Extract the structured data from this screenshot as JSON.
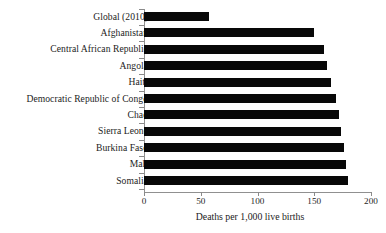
{
  "chart_data": {
    "type": "bar",
    "orientation": "horizontal",
    "title": "",
    "xlabel": "Deaths per 1,000 live births",
    "ylabel": "",
    "xlim": [
      0,
      200
    ],
    "xticks": [
      0,
      50,
      100,
      150,
      200
    ],
    "xtick_labels": [
      "0",
      "50",
      "100",
      "150",
      "200"
    ],
    "grid": false,
    "legend": null,
    "bar_color": "#080808",
    "axis_color": "#909090",
    "categories": [
      "Global (2010)",
      "Afghanistan",
      "Central African Republic",
      "Angola",
      "Haiti",
      "Democratic Republic of Congo",
      "Chad",
      "Sierra Leone",
      "Burkina Faso",
      "Mali",
      "Somalia"
    ],
    "values": [
      57,
      150,
      159,
      161,
      165,
      169,
      172,
      174,
      176,
      178,
      180
    ]
  }
}
